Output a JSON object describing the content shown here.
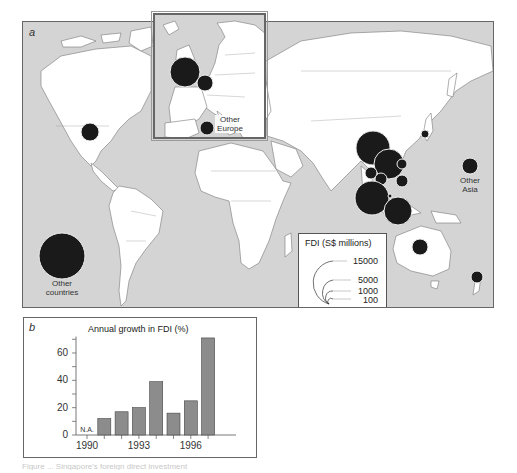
{
  "figure": {
    "panel_a_label": "a",
    "panel_b_label": "b",
    "caption": "Figure ... Singapore's foreign direct investment"
  },
  "map": {
    "background_color": "#d4d4d4",
    "land_color": "#ffffff",
    "bubble_color": "#1a1a1a",
    "labels": {
      "other_countries": "Other countries",
      "other_asia": "Other Asia",
      "other_europe": "Other Europe"
    },
    "bubbles": [
      {
        "name": "USA",
        "cx": 89,
        "cy": 131,
        "r": 9
      },
      {
        "name": "Other countries",
        "cx": 61,
        "cy": 255,
        "r": 23
      },
      {
        "name": "China",
        "cx": 372,
        "cy": 147,
        "r": 17
      },
      {
        "name": "Hong Kong",
        "cx": 388,
        "cy": 163,
        "r": 15
      },
      {
        "name": "Taiwan",
        "cx": 401,
        "cy": 163,
        "r": 5
      },
      {
        "name": "Vietnam",
        "cx": 370,
        "cy": 172,
        "r": 6
      },
      {
        "name": "Thailand",
        "cx": 380,
        "cy": 178,
        "r": 6
      },
      {
        "name": "Philippines",
        "cx": 401,
        "cy": 180,
        "r": 6
      },
      {
        "name": "Malaysia",
        "cx": 371,
        "cy": 197,
        "r": 17
      },
      {
        "name": "Indonesia",
        "cx": 397,
        "cy": 210,
        "r": 14
      },
      {
        "name": "Japan",
        "cx": 424,
        "cy": 133,
        "r": 4
      },
      {
        "name": "Brunei",
        "cx": 389,
        "cy": 195,
        "r": 2
      },
      {
        "name": "Other Asia",
        "cx": 469,
        "cy": 165,
        "r": 8
      },
      {
        "name": "Australia",
        "cx": 419,
        "cy": 246,
        "r": 8
      },
      {
        "name": "New Zealand",
        "cx": 476,
        "cy": 276,
        "r": 6
      }
    ],
    "inset_bubbles": [
      {
        "name": "UK",
        "cx": 30,
        "cy": 57,
        "r": 15
      },
      {
        "name": "Netherlands",
        "cx": 50,
        "cy": 68,
        "r": 8
      },
      {
        "name": "Other Europe",
        "cx": 52,
        "cy": 113,
        "r": 7
      }
    ]
  },
  "legend": {
    "title": "FDI (S$ millions)",
    "values": [
      "15000",
      "5000",
      "1000",
      "100"
    ]
  },
  "chart_data": {
    "type": "bar",
    "title": "Annual growth in FDI (%)",
    "xlabel": "",
    "ylabel": "",
    "categories": [
      "1990",
      "1991",
      "1992",
      "1993",
      "1994",
      "1995",
      "1996",
      "1997"
    ],
    "values": [
      null,
      12,
      17,
      20,
      39,
      16,
      25,
      71
    ],
    "annotations": [
      {
        "category": "1990",
        "text": "N.A."
      }
    ],
    "x_tick_labels": [
      "1990",
      "1993",
      "1996"
    ],
    "y_tick_labels": [
      "0",
      "20",
      "40",
      "60"
    ],
    "ylim": [
      0,
      72
    ],
    "grid": false,
    "bar_color": "#8c8c8c"
  }
}
